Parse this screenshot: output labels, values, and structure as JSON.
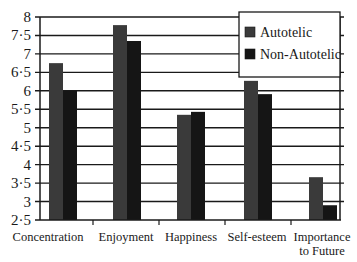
{
  "chart_data": {
    "type": "bar",
    "title": "",
    "xlabel": "",
    "ylabel": "",
    "categories": [
      "Concentration",
      "Enjoyment",
      "Happiness",
      "Self-esteem",
      "Importance to Future"
    ],
    "category_lines": [
      [
        "Concentration"
      ],
      [
        "Enjoyment"
      ],
      [
        "Happiness"
      ],
      [
        "Self-esteem"
      ],
      [
        "Importance",
        "to Future"
      ]
    ],
    "series": [
      {
        "name": "Autotelic",
        "color": "#3a3a3a",
        "values": [
          6.75,
          7.78,
          5.35,
          6.27,
          3.66
        ]
      },
      {
        "name": "Non-Autotelic",
        "color": "#151515",
        "values": [
          6.0,
          7.35,
          5.43,
          5.91,
          2.9
        ]
      }
    ],
    "ylim": [
      2.5,
      8
    ],
    "yticks": [
      2.5,
      3,
      3.5,
      4,
      4.5,
      5,
      5.5,
      6,
      6.5,
      7,
      7.5,
      8
    ],
    "ytick_labels": [
      "2·5",
      "3",
      "3·5",
      "4",
      "4·5",
      "5",
      "5·5",
      "6",
      "6·5",
      "7",
      "7·5",
      "8"
    ],
    "grid": true,
    "legend_position": "upper right"
  }
}
